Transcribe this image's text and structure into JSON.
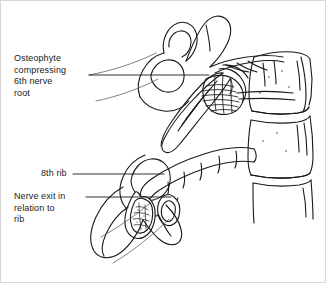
{
  "figure": {
    "background_color": "#ffffff",
    "line_color": "#1a1a1a",
    "border_color": "#d8d8d8"
  },
  "labels": [
    {
      "id": "osteophyte",
      "text": "Osteophyte\ncompressing\n6th nerve\nroot",
      "leader_line": {
        "x1": 88,
        "y1": 74,
        "x2": 208,
        "y2": 74
      }
    },
    {
      "id": "rib",
      "text": "8th rib",
      "leader_line": {
        "x1": 72,
        "y1": 173,
        "x2": 163,
        "y2": 173
      }
    },
    {
      "id": "nerve_exit",
      "text": "Nerve exit in\nrelation to\nrib",
      "leader_line": {
        "x1": 85,
        "y1": 196,
        "x2": 170,
        "y2": 196
      }
    }
  ],
  "anatomy": {
    "structures": [
      "superior articular process",
      "spinous process",
      "vertebral body upper",
      "intervertebral disc",
      "vertebral body lower",
      "osteophyte",
      "nerve root",
      "8th rib",
      "rib cross section",
      "transverse process"
    ]
  }
}
